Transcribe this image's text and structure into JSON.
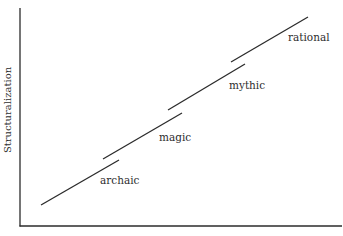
{
  "chart_data": {
    "type": "line",
    "title": "",
    "ylabel": "Structuralization",
    "xlabel": "",
    "grid": false,
    "legend": null,
    "series": [
      {
        "name": "archaic",
        "x": [
          0.07,
          0.31
        ],
        "y": [
          0.1,
          0.31
        ]
      },
      {
        "name": "magic",
        "x": [
          0.26,
          0.5
        ],
        "y": [
          0.31,
          0.52
        ]
      },
      {
        "name": "mythic",
        "x": [
          0.46,
          0.7
        ],
        "y": [
          0.53,
          0.74
        ]
      },
      {
        "name": "rational",
        "x": [
          0.66,
          0.9
        ],
        "y": [
          0.75,
          0.96
        ]
      }
    ],
    "annotations": [
      "archaic",
      "magic",
      "mythic",
      "rational"
    ],
    "xlim": [
      0,
      1
    ],
    "ylim": [
      0,
      1
    ]
  },
  "axes": {
    "y_label": "Structuralization",
    "x_label_partial": ""
  },
  "segments": [
    {
      "label": "archaic",
      "x1": 41,
      "y1": 205,
      "x2": 119,
      "y2": 160,
      "lx": 100,
      "ly": 184
    },
    {
      "label": "magic",
      "x1": 103,
      "y1": 159,
      "x2": 182,
      "y2": 113,
      "lx": 159,
      "ly": 141
    },
    {
      "label": "mythic",
      "x1": 168,
      "y1": 110,
      "x2": 245,
      "y2": 64,
      "lx": 229,
      "ly": 89
    },
    {
      "label": "rational",
      "x1": 231,
      "y1": 62,
      "x2": 308,
      "y2": 17,
      "lx": 288,
      "ly": 41
    }
  ],
  "colors": {
    "line": "#2b2b2b",
    "axis": "#2b2b2b",
    "text": "#2e2e2e"
  }
}
